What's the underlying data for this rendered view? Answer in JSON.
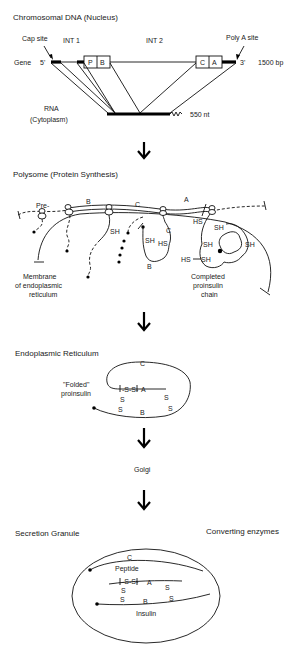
{
  "sections": {
    "gene": {
      "title": "Chromosomal DNA (Nucleus)",
      "cap_site": "Cap site",
      "poly_a_site": "Poly A site",
      "int1": "INT 1",
      "int2": "INT 2",
      "gene_label": "Gene",
      "five_prime": "5'",
      "three_prime": "3'",
      "size_bp": "1500 bp",
      "exons": [
        "P",
        "B",
        "C",
        "A"
      ],
      "rna_label": "RNA",
      "rna_sub": "(Cytoplasm)",
      "rna_size": "550 nt"
    },
    "polysome": {
      "title": "Polysome (Protein Synthesis)",
      "labels": {
        "pre": "Pre-",
        "b": "B",
        "c": "C",
        "a": "A",
        "c2": "C",
        "b2": "B"
      },
      "sh": "SH",
      "hs": "HS",
      "membrane_lines": [
        "Membrane",
        "of endoplasmic",
        "reticulum"
      ],
      "completed_lines": [
        "Completed",
        "proinsulin",
        "chain"
      ]
    },
    "er": {
      "title": "Endoplasmic Reticulum",
      "folded_lines": [
        "\"Folded\"",
        "proinsulin"
      ],
      "c": "C",
      "a": "A",
      "b": "B",
      "ss_bridge": "-S-S-",
      "s": "S"
    },
    "golgi": {
      "title": "Golgi"
    },
    "granule": {
      "title": "Secretion Granule",
      "enzymes": "Converting enzymes",
      "c": "C",
      "peptide": "Peptide",
      "a": "A",
      "b": "B",
      "insulin": "Insulin",
      "ss_bridge": "-S-S-",
      "s": "S"
    }
  },
  "arrows": [
    "down-arrow",
    "down-arrow",
    "down-arrow",
    "down-arrow"
  ]
}
